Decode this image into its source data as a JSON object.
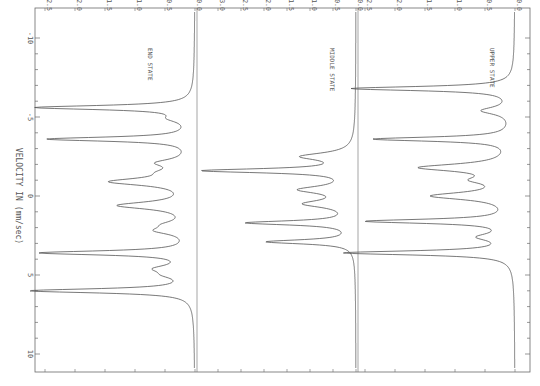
{
  "chart_data": {
    "type": "line",
    "orientation": "rotated-90-clockwise",
    "xlabel": "VELOCITY IN (mm/sec)",
    "xlim": [
      -10.5,
      10.5
    ],
    "x_ticks": [
      -10,
      -5,
      0,
      5,
      10
    ],
    "panels": [
      {
        "name": "END STATE",
        "ylim": [
          0.0,
          2.5
        ],
        "y_ticks": [
          "0.0",
          "0.5",
          "1.0",
          "1.5",
          "2.0",
          "2.5"
        ],
        "peaks": [
          {
            "x": -5.6,
            "depth": 2.6
          },
          {
            "x": -4.9,
            "depth": 0.3
          },
          {
            "x": -3.6,
            "depth": 2.4
          },
          {
            "x": -2.1,
            "depth": 0.5
          },
          {
            "x": -1.5,
            "depth": 0.3
          },
          {
            "x": -0.9,
            "depth": 1.3
          },
          {
            "x": 0.6,
            "depth": 1.2
          },
          {
            "x": 1.8,
            "depth": 0.3
          },
          {
            "x": 2.2,
            "depth": 0.5
          },
          {
            "x": 3.6,
            "depth": 2.5
          },
          {
            "x": 4.6,
            "depth": 0.5
          },
          {
            "x": 5.0,
            "depth": 0.3
          },
          {
            "x": 6.0,
            "depth": 2.7
          }
        ]
      },
      {
        "name": "MIDDLE STATE",
        "ylim": [
          0.0,
          3.0
        ],
        "y_ticks": [
          "0.0",
          "0.5",
          "1.0",
          "1.5",
          "2.0",
          "2.5",
          "3.0"
        ],
        "peaks": [
          {
            "x": -2.5,
            "depth": 1.1
          },
          {
            "x": -1.6,
            "depth": 3.2
          },
          {
            "x": -0.4,
            "depth": 1.1
          },
          {
            "x": 0.5,
            "depth": 1.0
          },
          {
            "x": 1.7,
            "depth": 2.3
          },
          {
            "x": 2.9,
            "depth": 1.9
          }
        ]
      },
      {
        "name": "UPPER STATE",
        "ylim": [
          0.0,
          2.5
        ],
        "y_ticks": [
          "0.0",
          "0.5",
          "1.0",
          "1.5",
          "2.0",
          "2.5"
        ],
        "peaks": [
          {
            "x": -6.8,
            "depth": 2.7
          },
          {
            "x": -5.4,
            "depth": 0.5
          },
          {
            "x": -3.6,
            "depth": 2.3
          },
          {
            "x": -1.8,
            "depth": 1.5
          },
          {
            "x": -1.0,
            "depth": 0.5
          },
          {
            "x": 0.0,
            "depth": 1.3
          },
          {
            "x": 1.6,
            "depth": 2.4
          },
          {
            "x": 2.6,
            "depth": 0.5
          },
          {
            "x": 3.6,
            "depth": 2.8
          }
        ]
      }
    ],
    "grid": false,
    "legend": "none"
  }
}
